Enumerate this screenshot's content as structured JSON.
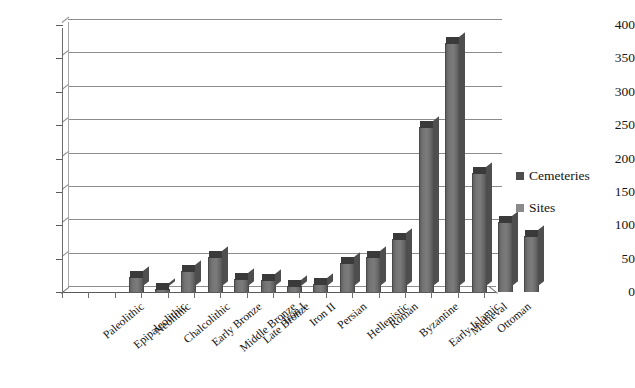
{
  "chart_data": {
    "type": "bar",
    "title": "",
    "xlabel": "",
    "ylabel": "",
    "ylim": [
      0,
      400
    ],
    "yticks": [
      0,
      50,
      100,
      150,
      200,
      250,
      300,
      350,
      400
    ],
    "grid": true,
    "legend_position": "right",
    "style": "3d-column",
    "categories": [
      "Paleolithic",
      "Epipaleolithic",
      "Neolithic",
      "Chalcolithic",
      "Early Bronze",
      "Middle Bronze",
      "Late Bronze",
      "Iron I",
      "Iron II",
      "Persian",
      "Hellenistic",
      "Roman",
      "Byzantine",
      "Early Islamic",
      "Medieval",
      "Ottoman"
    ],
    "series": [
      {
        "name": "Cemeteries",
        "color": "#3a3a3a",
        "values": [
          0,
          0,
          0,
          0,
          0,
          0,
          0,
          0,
          0,
          0,
          0,
          0,
          0,
          0,
          0,
          0
        ]
      },
      {
        "name": "Sites",
        "color": "#7b7b7b",
        "values": [
          22,
          5,
          32,
          53,
          20,
          18,
          9,
          12,
          43,
          53,
          80,
          247,
          373,
          178,
          105,
          84
        ]
      }
    ]
  },
  "legend": {
    "items": [
      {
        "label": "Cemeteries",
        "color": "#4f4f4f"
      },
      {
        "label": "Sites",
        "color": "#8a8a8a"
      }
    ]
  },
  "axis": {
    "y_tick_labels": [
      "400",
      "350",
      "300",
      "250",
      "200",
      "150",
      "100",
      "50",
      "0"
    ]
  }
}
